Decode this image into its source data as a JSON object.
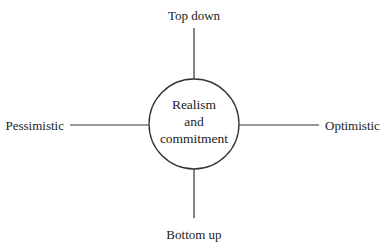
{
  "diagram": {
    "type": "quadrant-axes",
    "center": {
      "lines": [
        "Realism",
        "and",
        "commitment"
      ]
    },
    "axes": {
      "top": "Top down",
      "bottom": "Bottom up",
      "left": "Pessimistic",
      "right": "Optimistic"
    },
    "colors": {
      "stroke": "#333333",
      "text": "#222222",
      "background": "#ffffff"
    }
  }
}
